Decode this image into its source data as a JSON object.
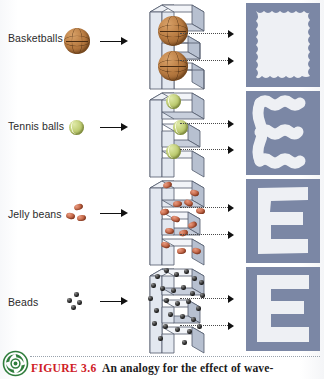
{
  "figure": {
    "number": "FIGURE 3.6",
    "caption_text": "An analogy for the effect of wave-",
    "logo_icon": "green-spiral-leaf-logo"
  },
  "colors": {
    "figure_label": "#cf2026",
    "caption_text": "#1b1b1b",
    "output_letter_bg": "#7b87a5",
    "output_letter_fg": "#eef0f4",
    "stencil_face": "#e7eaf0",
    "stencil_side": "#b9c1cf",
    "basketball": "#b97c42",
    "tennis_ball": "#bfcd74",
    "jelly_bean": "#c86a4a",
    "bead": "#1a1a1a",
    "arrow": "#111111",
    "dotted_arrow": "#4a4a4a"
  },
  "rows": [
    {
      "label": "Basketballs",
      "particle_icon": "basketball-icon",
      "particle_count_incoming": 1,
      "particle_count_in_stencil": 2,
      "resolution_level": "none",
      "output_icon": "blurred-blob-output",
      "output_letter": "E"
    },
    {
      "label": "Tennis balls",
      "particle_icon": "tennis-ball-icon",
      "particle_count_incoming": 1,
      "particle_count_in_stencil": 3,
      "resolution_level": "low",
      "output_icon": "wavy-letter-e-output",
      "output_letter": "E"
    },
    {
      "label": "Jelly beans",
      "particle_icon": "jelly-bean-icon",
      "particle_count_incoming": 3,
      "particle_count_in_stencil": 13,
      "resolution_level": "medium",
      "output_icon": "rough-letter-e-output",
      "output_letter": "E"
    },
    {
      "label": "Beads",
      "particle_icon": "bead-icon",
      "particle_count_incoming": 4,
      "particle_count_in_stencil": 28,
      "resolution_level": "high",
      "output_icon": "sharp-letter-e-output",
      "output_letter": "E"
    }
  ],
  "arrows": {
    "incoming_icon": "solid-right-arrow-icon",
    "outgoing_icon": "dotted-right-arrow-icon",
    "outgoing_count_per_row": 2
  },
  "stencil": {
    "icon": "e-shaped-slot-stencil-icon",
    "description": "Letter E cut out of a 3D plate"
  }
}
